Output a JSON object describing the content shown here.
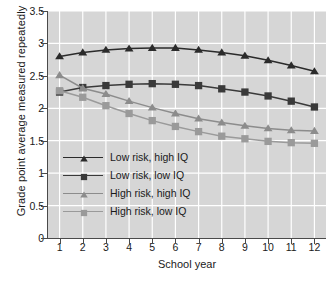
{
  "chart_data": {
    "type": "line",
    "title": "",
    "xlabel": "School year",
    "ylabel": "Grade point average measured repeatedly",
    "x": [
      1,
      2,
      3,
      4,
      5,
      6,
      7,
      8,
      9,
      10,
      11,
      12
    ],
    "xtick_labels": [
      "1",
      "2",
      "3",
      "4",
      "5",
      "6",
      "7",
      "8",
      "9",
      "10",
      "11",
      "12"
    ],
    "ytick_labels": [
      "0",
      "0.5",
      "1",
      "1.5",
      "2",
      "2.5",
      "3",
      "3.5"
    ],
    "ytick_values": [
      0,
      0.5,
      1,
      1.5,
      2,
      2.5,
      3,
      3.5
    ],
    "xlim": [
      0.5,
      12.5
    ],
    "ylim": [
      0,
      3.5
    ],
    "grid": true,
    "legend_position": "center-left",
    "plot_background": "#d6d6d6",
    "series": [
      {
        "name": "Low risk, high IQ",
        "color": "#2b2b2b",
        "marker": "triangle",
        "values": [
          2.8,
          2.86,
          2.9,
          2.92,
          2.93,
          2.93,
          2.9,
          2.86,
          2.81,
          2.74,
          2.66,
          2.57
        ]
      },
      {
        "name": "Low risk, low IQ",
        "color": "#3a3a3a",
        "marker": "square",
        "values": [
          2.25,
          2.32,
          2.35,
          2.37,
          2.38,
          2.37,
          2.35,
          2.3,
          2.25,
          2.19,
          2.11,
          2.02
        ]
      },
      {
        "name": "High risk, high IQ",
        "color": "#8c8c8c",
        "marker": "triangle",
        "values": [
          2.51,
          2.31,
          2.22,
          2.11,
          2.01,
          1.92,
          1.84,
          1.78,
          1.73,
          1.69,
          1.66,
          1.65
        ]
      },
      {
        "name": "High risk, low IQ",
        "color": "#9a9a9a",
        "marker": "square",
        "values": [
          2.27,
          2.17,
          2.04,
          1.92,
          1.81,
          1.72,
          1.64,
          1.57,
          1.53,
          1.49,
          1.47,
          1.46
        ]
      }
    ]
  }
}
